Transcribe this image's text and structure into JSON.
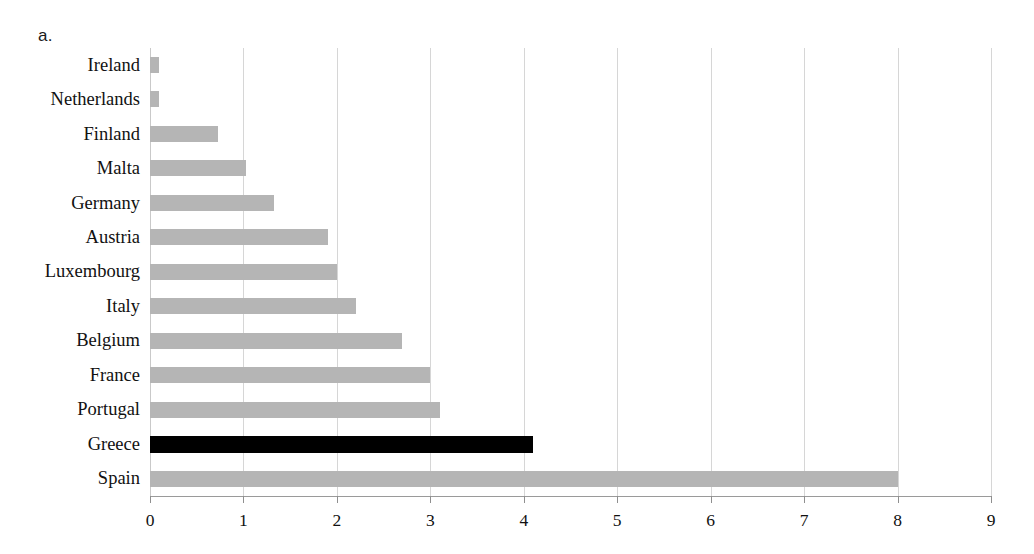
{
  "panel": {
    "letter": "a."
  },
  "chart_data": {
    "type": "bar",
    "orientation": "horizontal",
    "title": "",
    "xlabel": "",
    "ylabel": "",
    "xlim": [
      0,
      9
    ],
    "grid": true,
    "legend": null,
    "categories": [
      "Ireland",
      "Netherlands",
      "Finland",
      "Malta",
      "Germany",
      "Austria",
      "Luxembourg",
      "Italy",
      "Belgium",
      "France",
      "Portugal",
      "Greece",
      "Spain"
    ],
    "values": [
      0.1,
      0.1,
      0.73,
      1.03,
      1.33,
      1.9,
      2.0,
      2.2,
      2.7,
      3.0,
      3.1,
      4.1,
      8.0
    ],
    "xticks": [
      "0",
      "1",
      "2",
      "3",
      "4",
      "5",
      "6",
      "7",
      "8",
      "9"
    ],
    "highlight_category": "Greece",
    "colors": {
      "bar": "#b5b5b5",
      "highlight": "#000000",
      "gridline": "#d6d6d6",
      "axis": "#9a9a9a",
      "text": "#111111"
    }
  }
}
